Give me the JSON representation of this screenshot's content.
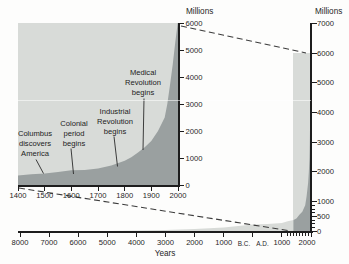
{
  "figure_description": "World human population growth from 8000 B.C. to A.D. 2000 with magnified inset of years 1400-2000",
  "colors": {
    "population_area": "#9aa0a0",
    "zoom_band": "#d8dbd8",
    "axis": "#1d1d1d",
    "text": "#1f1f1f"
  },
  "inset_axis": {
    "y_title": "Millions",
    "y_labels": [
      "6000",
      "5000",
      "4000",
      "3000",
      "2000",
      "1000",
      "0"
    ],
    "x_labels": [
      "1400",
      "1500",
      "1600",
      "1700",
      "1800",
      "1900",
      "2000"
    ]
  },
  "main_axis": {
    "y_title": "Millions",
    "y_labels": [
      "7000",
      "6000",
      "5000",
      "4000",
      "3000",
      "2000",
      "1000",
      "500",
      "0"
    ],
    "x_labels": [
      "8000",
      "7000",
      "6000",
      "5000",
      "4000",
      "3000",
      "2000",
      "1000",
      "B.C.",
      "A.D.",
      "1000",
      "2000"
    ],
    "x_title": "Years"
  },
  "chart_data": [
    {
      "name": "inset",
      "type": "area",
      "description": "World population, magnified view 1400-2000",
      "ylabel": "Millions",
      "xlim": [
        1400,
        2000
      ],
      "ylim": [
        0,
        6000
      ],
      "x_ticks": [
        1400,
        1500,
        1600,
        1700,
        1800,
        1900,
        2000
      ],
      "y_ticks": [
        0,
        1000,
        2000,
        3000,
        4000,
        5000,
        6000
      ],
      "grid": false,
      "points": [
        [
          1400,
          350
        ],
        [
          1450,
          395
        ],
        [
          1500,
          425
        ],
        [
          1550,
          480
        ],
        [
          1600,
          545
        ],
        [
          1650,
          560
        ],
        [
          1700,
          610
        ],
        [
          1750,
          720
        ],
        [
          1800,
          900
        ],
        [
          1825,
          1030
        ],
        [
          1850,
          1200
        ],
        [
          1875,
          1400
        ],
        [
          1900,
          1625
        ],
        [
          1925,
          2000
        ],
        [
          1950,
          2500
        ],
        [
          1960,
          3000
        ],
        [
          1970,
          3700
        ],
        [
          1980,
          4450
        ],
        [
          1990,
          5300
        ],
        [
          2000,
          6080
        ]
      ],
      "annotations": [
        {
          "lines": [
            "Columbus",
            "discovers",
            "America"
          ],
          "year": 1492
        },
        {
          "lines": [
            "Colonial",
            "period",
            "begins"
          ],
          "year": 1607
        },
        {
          "lines": [
            "Industrial",
            "Revolution",
            "begins"
          ],
          "year": 1760
        },
        {
          "lines": [
            "Medical",
            "Revolution",
            "begins"
          ],
          "year": 1875
        }
      ]
    },
    {
      "name": "main",
      "type": "area",
      "description": "World population 8000 B.C. to A.D. 2000",
      "xlabel": "Years",
      "ylabel": "Millions",
      "xlim": [
        -8000,
        2000
      ],
      "ylim": [
        0,
        7000
      ],
      "x_ticks": [
        -8000,
        -7000,
        -6000,
        -5000,
        -4000,
        -3000,
        -2000,
        -1000,
        0,
        1000,
        2000
      ],
      "y_ticks": [
        0,
        500,
        1000,
        2000,
        3000,
        4000,
        5000,
        6000,
        7000
      ],
      "highlight_band_years": [
        1400,
        2000
      ],
      "grid": false,
      "points": [
        [
          -8000,
          5
        ],
        [
          -7000,
          8
        ],
        [
          -6000,
          15
        ],
        [
          -5000,
          30
        ],
        [
          -4000,
          50
        ],
        [
          -3000,
          70
        ],
        [
          -2000,
          100
        ],
        [
          -1000,
          150
        ],
        [
          0,
          250
        ],
        [
          500,
          270
        ],
        [
          1000,
          300
        ],
        [
          1200,
          360
        ],
        [
          1400,
          400
        ],
        [
          1500,
          450
        ],
        [
          1600,
          580
        ],
        [
          1700,
          680
        ],
        [
          1800,
          900
        ],
        [
          1850,
          1200
        ],
        [
          1900,
          1650
        ],
        [
          1925,
          2000
        ],
        [
          1950,
          2500
        ],
        [
          1960,
          3000
        ],
        [
          1970,
          3700
        ],
        [
          1980,
          4450
        ],
        [
          1990,
          5300
        ],
        [
          2000,
          6080
        ]
      ]
    }
  ]
}
